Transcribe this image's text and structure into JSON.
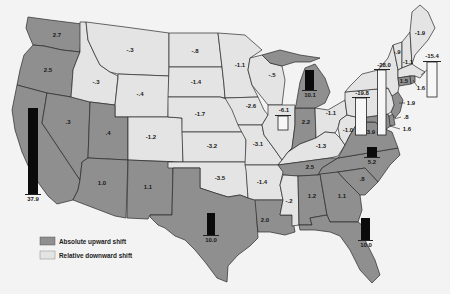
{
  "map": {
    "legend": [
      {
        "label": "Absolute upward shift",
        "shift": "up"
      },
      {
        "label": "Relative downward shift",
        "shift": "down"
      }
    ],
    "colors": {
      "upward": "#8f8f8f",
      "downward": "#e4e4e4",
      "bar_positive": "#0b0b0b"
    },
    "states": {
      "WA": {
        "value": "2.7",
        "shift": "up"
      },
      "OR": {
        "value": "2.5",
        "shift": "up"
      },
      "CA": {
        "value": "37.9",
        "shift": "up"
      },
      "NV": {
        "value": ".3",
        "shift": "up"
      },
      "ID": {
        "value": "-.3",
        "shift": "down"
      },
      "MT": {
        "value": "-.3",
        "shift": "down"
      },
      "WY": {
        "value": "-.4",
        "shift": "down"
      },
      "UT": {
        "value": ".4",
        "shift": "up"
      },
      "CO": {
        "value": "-1.2",
        "shift": "down"
      },
      "AZ": {
        "value": "1.0",
        "shift": "up"
      },
      "NM": {
        "value": "1.1",
        "shift": "up"
      },
      "ND": {
        "value": "-.8",
        "shift": "down"
      },
      "SD": {
        "value": "-1.4",
        "shift": "down"
      },
      "NE": {
        "value": "-1.7",
        "shift": "down"
      },
      "KS": {
        "value": "-3.2",
        "shift": "down"
      },
      "OK": {
        "value": "-3.5",
        "shift": "down"
      },
      "TX": {
        "value": "10.0",
        "shift": "up"
      },
      "MN": {
        "value": "-1.1",
        "shift": "down"
      },
      "WI": {
        "value": "-.5",
        "shift": "down"
      },
      "IA": {
        "value": "-2.6",
        "shift": "down"
      },
      "MO": {
        "value": "-3.1",
        "shift": "down"
      },
      "IL": {
        "value": "-6.1",
        "shift": "down"
      },
      "IN": {
        "value": "2.2",
        "shift": "up"
      },
      "MI": {
        "value": "10.1",
        "shift": "up"
      },
      "OH": {
        "value": "-1.1",
        "shift": "down"
      },
      "KY": {
        "value": "-1.3",
        "shift": "down"
      },
      "WV": {
        "value": "-1.0",
        "shift": "down"
      },
      "TN": {
        "value": "2.5",
        "shift": "up"
      },
      "AR": {
        "value": "-1.4",
        "shift": "down"
      },
      "LA": {
        "value": "2.0",
        "shift": "up"
      },
      "MS": {
        "value": "-.2",
        "shift": "down"
      },
      "AL": {
        "value": "1.2",
        "shift": "up"
      },
      "GA": {
        "value": "1.1",
        "shift": "up"
      },
      "SC": {
        "value": ".8",
        "shift": "up"
      },
      "NC": {
        "value": "5.2",
        "shift": "up"
      },
      "VA": {
        "value": "3.9",
        "shift": "up"
      },
      "FL": {
        "value": "10.0",
        "shift": "up"
      },
      "PA": {
        "value": "-19.8",
        "shift": "down"
      },
      "NY": {
        "value": "-28.0",
        "shift": "down"
      },
      "MD": {
        "value": "1.6",
        "shift": "up"
      },
      "DE": {
        "value": ".8",
        "shift": "up"
      },
      "NJ": {
        "value": "1.9",
        "shift": "up"
      },
      "CT": {
        "value": "1.5",
        "shift": "up"
      },
      "RI": {
        "value": "1.6",
        "shift": "up"
      },
      "MA": {
        "value": "-15.4",
        "shift": "down"
      },
      "VT": {
        "value": "-.9",
        "shift": "down"
      },
      "NH": {
        "value": "-1.1",
        "shift": "down"
      },
      "ME": {
        "value": "-1.9",
        "shift": "down"
      }
    }
  }
}
